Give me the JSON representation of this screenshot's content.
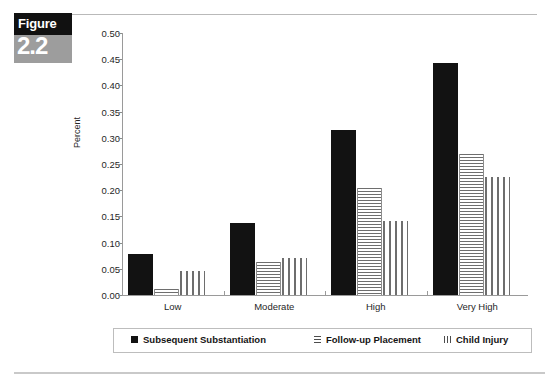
{
  "figure_badge": {
    "word": "Figure",
    "number": "2.2"
  },
  "chart_data": {
    "type": "bar",
    "title": "",
    "xlabel": "",
    "ylabel": "Percent",
    "ylim": [
      0.0,
      0.5
    ],
    "ytick_step": 0.05,
    "grid": false,
    "legend_position": "bottom",
    "categories": [
      "Low",
      "Moderate",
      "High",
      "Very High"
    ],
    "ytick_labels": [
      "0.00",
      "0.05",
      "0.10",
      "0.15",
      "0.20",
      "0.25",
      "0.30",
      "0.35",
      "0.40",
      "0.45",
      "0.50"
    ],
    "series": [
      {
        "name": "Subsequent Substantiation",
        "pattern": "solid-black",
        "values": [
          0.078,
          0.137,
          0.315,
          0.443
        ]
      },
      {
        "name": "Follow-up Placement",
        "pattern": "horizontal-stripes",
        "values": [
          0.012,
          0.063,
          0.205,
          0.27
        ]
      },
      {
        "name": "Child Injury",
        "pattern": "vertical-stripes",
        "values": [
          0.045,
          0.07,
          0.142,
          0.225
        ]
      }
    ]
  }
}
